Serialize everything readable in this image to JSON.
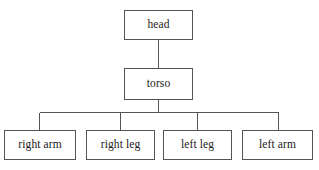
{
  "diagram": {
    "type": "tree",
    "orientation": "top-down",
    "background_color": "#ffffff",
    "stroke_color": "#555555",
    "text_color": "#1a1a1a",
    "nodes": [
      {
        "id": "head",
        "label": "head",
        "level": 0,
        "x": 124,
        "y": 10,
        "width": 69,
        "height": 30
      },
      {
        "id": "torso",
        "label": "torso",
        "level": 1,
        "x": 124,
        "y": 68,
        "width": 69,
        "height": 32
      },
      {
        "id": "right-arm",
        "label": "right arm",
        "level": 2,
        "x": 4,
        "y": 130,
        "width": 72,
        "height": 30
      },
      {
        "id": "right-leg",
        "label": "right leg",
        "level": 2,
        "x": 86,
        "y": 130,
        "width": 69,
        "height": 30
      },
      {
        "id": "left-leg",
        "label": "left leg",
        "level": 2,
        "x": 163,
        "y": 130,
        "width": 69,
        "height": 30
      },
      {
        "id": "left-arm",
        "label": "left arm",
        "level": 2,
        "x": 242,
        "y": 130,
        "width": 71,
        "height": 30
      }
    ],
    "edges": [
      {
        "from": "head",
        "to": "torso",
        "kind": "straight"
      },
      {
        "from": "torso",
        "to": "right-arm",
        "kind": "elbow"
      },
      {
        "from": "torso",
        "to": "right-leg",
        "kind": "elbow"
      },
      {
        "from": "torso",
        "to": "left-leg",
        "kind": "elbow"
      },
      {
        "from": "torso",
        "to": "left-arm",
        "kind": "elbow"
      }
    ],
    "edge_geometry": {
      "head_to_torso": "M158.5,40 L158.5,68",
      "torso_stem": "M158.5,100 L158.5,112.5",
      "bus": "M39.5,112.5 L278.5,112.5",
      "drop_right_arm": "M39.5,112.5 L39.5,130",
      "drop_right_leg": "M120.5,112.5 L120.5,130",
      "drop_left_leg": "M197.5,112.5 L197.5,130",
      "drop_left_arm": "M278.5,112.5 L278.5,130"
    }
  }
}
